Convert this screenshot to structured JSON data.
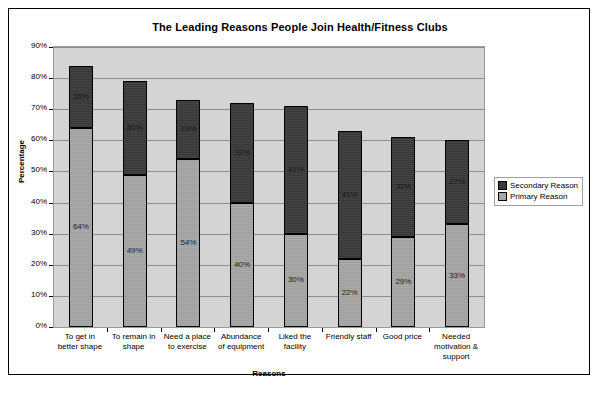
{
  "chart_data": {
    "type": "bar",
    "subtype": "stacked-column",
    "title": "The Leading Reasons People Join Health/Fitness Clubs",
    "xlabel": "Reasons",
    "ylabel": "Percentage",
    "ylim": [
      0,
      90
    ],
    "ytick_step": 10,
    "ytick_labels": [
      "90%",
      "80%",
      "70%",
      "60%",
      "50%",
      "40%",
      "30%",
      "20%",
      "10%",
      "0%"
    ],
    "grid": true,
    "legend_position": "right",
    "categories": [
      "To get in better shape",
      "To remain in shape",
      "Need a place to exercise",
      "Abundance of equipment",
      "Liked the facility",
      "Friendly staff",
      "Good price",
      "Needed motivation & support"
    ],
    "category_lines": [
      [
        "To get in",
        "better shape"
      ],
      [
        "To remain in",
        "shape"
      ],
      [
        "Need a place",
        "to exercise"
      ],
      [
        "Abundance",
        "of equipment"
      ],
      [
        "Liked the",
        "facility"
      ],
      [
        "Friendly staff"
      ],
      [
        "Good price"
      ],
      [
        "Needed",
        "motivation &",
        "support"
      ]
    ],
    "series": [
      {
        "name": "Primary Reason",
        "color": "#a5a5a5",
        "values": [
          64,
          49,
          54,
          40,
          30,
          22,
          29,
          33
        ],
        "labels": [
          "64%",
          "49%",
          "54%",
          "40%",
          "30%",
          "22%",
          "29%",
          "33%"
        ]
      },
      {
        "name": "Secondary Reason",
        "color": "#3a3a3a",
        "values": [
          20,
          30,
          19,
          32,
          41,
          41,
          32,
          27
        ],
        "labels": [
          "20%",
          "30%",
          "19%",
          "32%",
          "41%",
          "41%",
          "32%",
          "27%"
        ]
      }
    ],
    "totals": [
      84,
      79,
      73,
      72,
      71,
      63,
      61,
      60
    ]
  },
  "legend": {
    "entries": [
      {
        "label": "Secondary Reason",
        "color": "#3a3a3a"
      },
      {
        "label": "Primary Reason",
        "color": "#a5a5a5"
      }
    ]
  }
}
